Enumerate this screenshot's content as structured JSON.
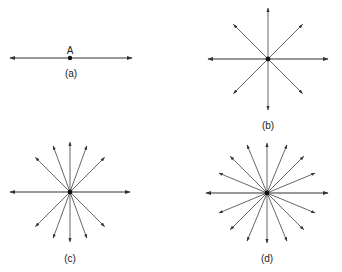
{
  "figures": {
    "a": {
      "caption": "(a)",
      "point_label": "A",
      "center": [
        70,
        58
      ],
      "line": {
        "x1": 10,
        "x2": 132
      }
    },
    "b": {
      "caption": "(b)",
      "center": [
        268,
        59
      ],
      "rays_deg": [
        0,
        45,
        90,
        135,
        180,
        225,
        270,
        315
      ],
      "radii": {
        "horizontal": 60,
        "vertical": 51,
        "diagonal": 49
      }
    },
    "c": {
      "caption": "(c)",
      "center": [
        70,
        192
      ],
      "rays_deg": [
        0,
        45,
        70,
        90,
        110,
        135,
        180,
        225,
        250,
        270,
        290,
        315
      ],
      "radii": {
        "horizontal": 60,
        "vertical": 50,
        "other": 49
      }
    },
    "d": {
      "caption": "(d)",
      "center": [
        267,
        193
      ],
      "rays_deg": [
        0,
        22.5,
        45,
        67.5,
        90,
        112.5,
        135,
        157.5,
        180,
        202.5,
        225,
        247.5,
        270,
        292.5,
        315,
        337.5
      ],
      "radii": {
        "horizontal": 61,
        "vertical": 50,
        "other": 52
      }
    }
  }
}
